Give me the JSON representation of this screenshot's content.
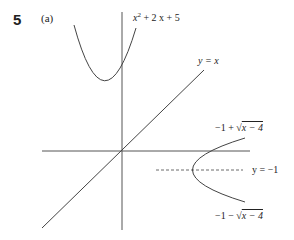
{
  "problem": {
    "number": "5",
    "part": "(a)"
  },
  "labels": {
    "parabola_up": {
      "x": "x",
      "sup": "2",
      "rest": " + 2 x + 5"
    },
    "line": "y = x",
    "upper_branch": {
      "pre": "−1 + √",
      "radicand": "x − 4"
    },
    "lower_branch": {
      "pre": "−1 − √",
      "radicand": "x − 4"
    },
    "asymptote": "y = −1"
  },
  "colors": {
    "stroke": "#444444",
    "text": "#222222"
  }
}
